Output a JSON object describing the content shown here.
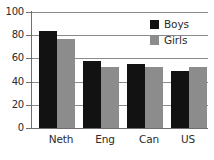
{
  "chart_data": {
    "type": "bar",
    "title": "",
    "subtitle": "",
    "xlabel": "",
    "ylabel": "",
    "categories": [
      "Neth",
      "Eng",
      "Can",
      "US"
    ],
    "series": [
      {
        "name": "Boys",
        "color": "#121212",
        "values": [
          84,
          58,
          55,
          49
        ]
      },
      {
        "name": "Girls",
        "color": "#8c8c8c",
        "values": [
          77,
          53,
          53,
          53
        ]
      }
    ],
    "ylim": [
      0,
      100
    ],
    "yticks": [
      0,
      20,
      40,
      60,
      80,
      100
    ],
    "ytick_labels": [
      "0",
      "20",
      "40",
      "60",
      "80",
      "100"
    ],
    "grid": true,
    "grid_axis": "y",
    "legend_position": "top-right",
    "legend": [
      "Boys",
      "Girls"
    ]
  }
}
